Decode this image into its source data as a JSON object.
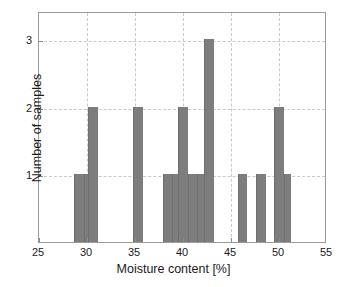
{
  "chart_data": {
    "type": "bar",
    "title": "",
    "subtitle": "",
    "xlabel": "Moisture content [%]",
    "ylabel": "Number of samples",
    "xlim": [
      25,
      55
    ],
    "ylim": [
      0,
      3.42
    ],
    "xticks": [
      25,
      30,
      35,
      40,
      45,
      50,
      55
    ],
    "xticklabels": [
      "25",
      "30",
      "35",
      "40",
      "45",
      "50",
      "55"
    ],
    "yticks": [
      1,
      2,
      3
    ],
    "yticklabels": [
      "1",
      "2",
      "3"
    ],
    "grid": true,
    "grid_style": "dashed",
    "legend": null,
    "bar_color": "#7d7d7d",
    "bin_width": 1,
    "bins": [
      {
        "x0": 28.6,
        "x1": 29.65,
        "value": 1
      },
      {
        "x0": 29.65,
        "x1": 30.1,
        "value": 1
      },
      {
        "x0": 30.1,
        "x1": 31.1,
        "value": 2
      },
      {
        "x0": 34.8,
        "x1": 35.8,
        "value": 2
      },
      {
        "x0": 37.9,
        "x1": 38.9,
        "value": 1
      },
      {
        "x0": 38.9,
        "x1": 39.5,
        "value": 1
      },
      {
        "x0": 39.5,
        "x1": 40.5,
        "value": 2
      },
      {
        "x0": 40.5,
        "x1": 41.5,
        "value": 1
      },
      {
        "x0": 41.5,
        "x1": 42.2,
        "value": 1
      },
      {
        "x0": 42.2,
        "x1": 43.2,
        "value": 3
      },
      {
        "x0": 45.7,
        "x1": 46.7,
        "value": 1
      },
      {
        "x0": 47.6,
        "x1": 48.6,
        "value": 1
      },
      {
        "x0": 49.5,
        "x1": 50.5,
        "value": 2
      },
      {
        "x0": 50.5,
        "x1": 51.2,
        "value": 1
      }
    ],
    "categories": [
      "28.6-29.65",
      "29.65-30.1",
      "30.1-31.1",
      "34.8-35.8",
      "37.9-38.9",
      "38.9-39.5",
      "39.5-40.5",
      "40.5-41.5",
      "41.5-42.2",
      "42.2-43.2",
      "45.7-46.7",
      "47.6-48.6",
      "49.5-50.5",
      "50.5-51.2"
    ],
    "values": [
      1,
      1,
      2,
      2,
      1,
      1,
      2,
      1,
      1,
      3,
      1,
      1,
      2,
      1
    ],
    "total_samples": 20
  }
}
